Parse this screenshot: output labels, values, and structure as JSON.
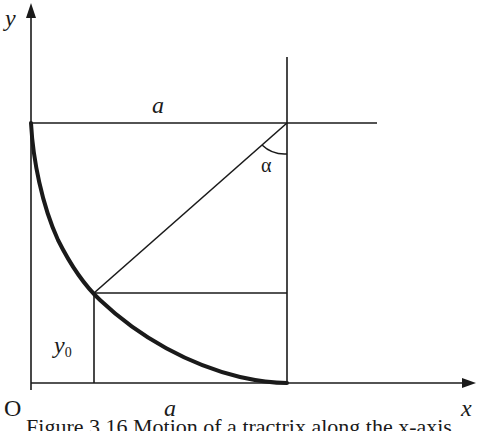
{
  "diagram": {
    "labels": {
      "y_axis": "y",
      "x_axis": "x",
      "origin": "O",
      "top_length": "a",
      "bottom_length": "a",
      "angle": "α",
      "y0_main": "y",
      "y0_sub": "0"
    },
    "caption": "Figure 3.16 Motion of a tractrix along the x-axis",
    "colors": {
      "stroke": "#1a1a1a",
      "background": "#ffffff"
    },
    "geometry": {
      "curve_type": "tractrix",
      "segment_length": "a",
      "point": {
        "label": "y0"
      }
    }
  }
}
